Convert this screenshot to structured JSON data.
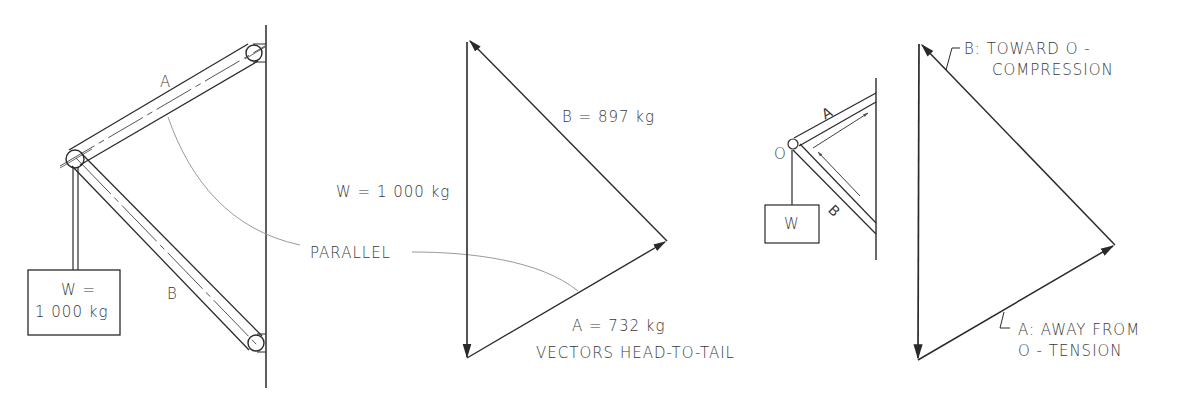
{
  "left_diagram": {
    "member_a_label": "A",
    "member_b_label": "B",
    "weight_line1": "W =",
    "weight_line2": "1 000 kg"
  },
  "middle_diagram": {
    "w_label": "W = 1 000 kg",
    "b_label": "B = 897 kg",
    "a_label": "A = 732 kg",
    "parallel_label": "PARALLEL",
    "caption": "VECTORS HEAD-TO-TAIL"
  },
  "right_small_diagram": {
    "member_a_label": "A",
    "member_b_label": "B",
    "joint_label": "O",
    "weight_label": "W"
  },
  "right_triangle": {
    "b_line1": "B: TOWARD O -",
    "b_line2": "COMPRESSION",
    "a_line1": "A: AWAY FROM",
    "a_line2": "O - TENSION"
  },
  "colors": {
    "stroke": "#2a2a2a",
    "leader": "#9a9a9a",
    "text": "#3a3a3a",
    "background": "#ffffff"
  }
}
